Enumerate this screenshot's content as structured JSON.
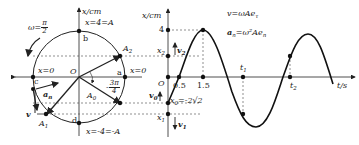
{
  "circle_diagram": {
    "omega_label": "ω=",
    "omega_num": "π",
    "omega_den": "2",
    "axis_label": "x/cm",
    "top_label": "x=4=A",
    "bottom_label": "x=-4=-A",
    "left_zero": "x=0",
    "right_zero": "x=0",
    "origin": "O",
    "points": {
      "a": "a",
      "b": "b",
      "c": "c",
      "d": "d"
    },
    "phasors": {
      "A0": "A",
      "A0_sub": "0",
      "A1": "A",
      "A1_sub": "1",
      "A2": "A",
      "A2_sub": "2"
    },
    "phase_num": "3π",
    "phase_den": "4",
    "phase_sign": "-",
    "accel_label": "a",
    "accel_sub": "n",
    "velocity_label": "v"
  },
  "graph": {
    "y_axis_label": "x/cm",
    "x_axis_label": "t/s",
    "y_tick_4": "4",
    "origin": "O",
    "x2_label": "x",
    "x2_sub": "2",
    "x1_label": "x",
    "x1_sub": "1",
    "x0_label": "x",
    "x0_sub": "0",
    "x0_value": "=-2√2",
    "v2_label": "v",
    "v2_sub": "2",
    "v0_label": "v",
    "v0_sub": "0",
    "v1_label": "v",
    "v1_sub": "1",
    "ticks": [
      "0.5",
      "1.5"
    ],
    "t1_label": "t",
    "t1_sub": "1",
    "t2_label": "t",
    "t2_sub": "2",
    "formula_v": "v=ωAe",
    "formula_v_sub": "τ",
    "formula_a": "a",
    "formula_a_sub": "n",
    "formula_a_rhs": "=ω²Ae",
    "formula_a_rhs_sub": "n"
  }
}
